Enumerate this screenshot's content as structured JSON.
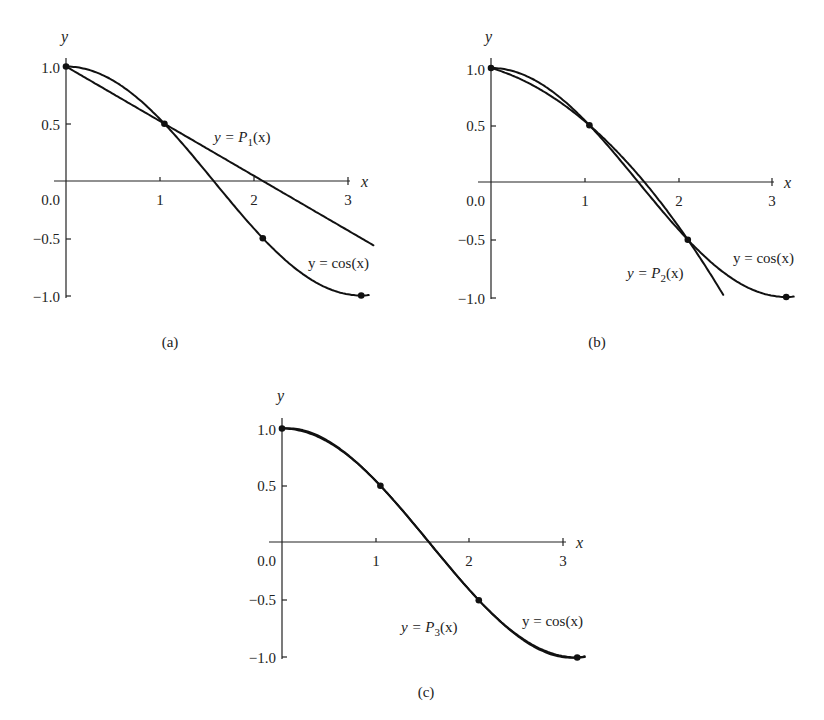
{
  "chart_data": [
    {
      "id": "a",
      "type": "line",
      "caption": "(a)",
      "xlabel": "x",
      "ylabel": "y",
      "xlim": [
        0,
        3.2
      ],
      "ylim": [
        -1.0,
        1.0
      ],
      "x_ticks": [
        "1",
        "2",
        "3"
      ],
      "y_ticks": [
        "1.0",
        "0.5",
        "0.0",
        "-0.5",
        "-1.0"
      ],
      "series": [
        {
          "name": "y = cos(x)",
          "function": "cos(x)",
          "x_range": [
            0,
            3.14
          ]
        },
        {
          "name": "y = P1(x)",
          "function": "linear interpolant through nodes 0, π/3",
          "x_range": [
            0,
            3.14
          ],
          "points": [
            [
              0,
              1.0
            ],
            [
              1.047,
              0.5
            ],
            [
              3.14,
              -0.5
            ]
          ]
        }
      ],
      "nodes": [
        [
          0,
          1.0
        ],
        [
          1.047,
          0.5
        ],
        [
          2.094,
          -0.5
        ],
        [
          3.14,
          -1.0
        ]
      ],
      "annotations": [
        {
          "text_prefix": "y = ",
          "func": "P",
          "sub": "1",
          "suffix": "(x)"
        },
        {
          "text": "y = cos(x)"
        }
      ]
    },
    {
      "id": "b",
      "type": "line",
      "caption": "(b)",
      "xlabel": "x",
      "ylabel": "y",
      "xlim": [
        0,
        3.2
      ],
      "ylim": [
        -1.0,
        1.0
      ],
      "x_ticks": [
        "1",
        "2",
        "3"
      ],
      "y_ticks": [
        "1.0",
        "0.5",
        "0.0",
        "-0.5",
        "-1.0"
      ],
      "series": [
        {
          "name": "y = cos(x)",
          "function": "cos(x)",
          "x_range": [
            0,
            3.14
          ]
        },
        {
          "name": "y = P2(x)",
          "function": "quadratic interpolant through nodes 0, π/3, 2π/3",
          "x_range": [
            0,
            2.45
          ]
        }
      ],
      "nodes": [
        [
          0,
          1.0
        ],
        [
          1.047,
          0.5
        ],
        [
          2.094,
          -0.5
        ],
        [
          3.14,
          -1.0
        ]
      ],
      "annotations": [
        {
          "text_prefix": "y = ",
          "func": "P",
          "sub": "2",
          "suffix": "(x)"
        },
        {
          "text": "y = cos(x)"
        }
      ]
    },
    {
      "id": "c",
      "type": "line",
      "caption": "(c)",
      "xlabel": "x",
      "ylabel": "y",
      "xlim": [
        0,
        3.2
      ],
      "ylim": [
        -1.0,
        1.0
      ],
      "x_ticks": [
        "1",
        "2",
        "3"
      ],
      "y_ticks": [
        "1.0",
        "0.5",
        "0.0",
        "-0.5",
        "-1.0"
      ],
      "series": [
        {
          "name": "y = cos(x)",
          "function": "cos(x)",
          "x_range": [
            0,
            3.14
          ]
        },
        {
          "name": "y = P3(x)",
          "function": "cubic interpolant through nodes 0, π/3, 2π/3, π (visually coincident with cos)",
          "x_range": [
            0,
            3.14
          ]
        }
      ],
      "nodes": [
        [
          0,
          1.0
        ],
        [
          1.047,
          0.5
        ],
        [
          2.094,
          -0.5
        ],
        [
          3.14,
          -1.0
        ]
      ],
      "annotations": [
        {
          "text_prefix": "y = ",
          "func": "P",
          "sub": "3",
          "suffix": "(x)"
        },
        {
          "text": "y = cos(x)"
        }
      ]
    }
  ],
  "labels": {
    "x": "x",
    "y": "y",
    "yticks": [
      "1.0",
      "0.5",
      "0.0",
      "−0.5",
      "−1.0"
    ],
    "xticks": [
      "1",
      "2",
      "3"
    ],
    "cos_label": "y = cos(x)",
    "p_prefix": "y = ",
    "p_func": "P",
    "p_suffix": "(x)",
    "p1_sub": "1",
    "p2_sub": "2",
    "p3_sub": "3",
    "cap_a": "(a)",
    "cap_b": "(b)",
    "cap_c": "(c)"
  }
}
